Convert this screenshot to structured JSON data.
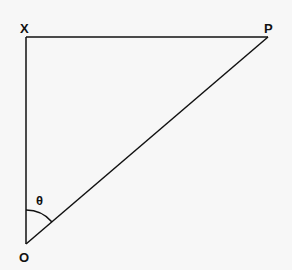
{
  "diagram": {
    "type": "right-triangle",
    "points": {
      "X": {
        "label": "X",
        "x": 26,
        "y": 37
      },
      "P": {
        "label": "P",
        "x": 268,
        "y": 37
      },
      "O": {
        "label": "O",
        "x": 26,
        "y": 244
      }
    },
    "angle": {
      "label": "θ",
      "at": "O",
      "between": [
        "OX",
        "OP"
      ]
    },
    "edges": [
      "XP",
      "XO",
      "OP"
    ],
    "line_color": "#111111"
  }
}
